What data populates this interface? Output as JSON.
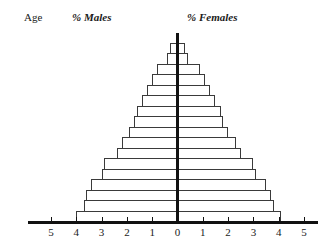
{
  "headings": {
    "age": "Age",
    "males": "% Males",
    "females": "% Females"
  },
  "axis": {
    "x_ticks": [
      "5",
      "4",
      "3",
      "2",
      "1",
      "0",
      "1",
      "2",
      "3",
      "4",
      "5"
    ],
    "x_min": -5,
    "x_max": 5,
    "unit": "%"
  },
  "chart_data": {
    "type": "bar",
    "subtype": "population-pyramid",
    "title": "",
    "subtitle": "",
    "xlabel": "",
    "ylabel": "Age",
    "xlim": [
      -5,
      5
    ],
    "grid": false,
    "legend_position": "top",
    "orientation": "horizontal",
    "categories": [
      "80+",
      "75–79",
      "70–74",
      "65–69",
      "60–64",
      "55–59",
      "50–54",
      "45–49",
      "40–44",
      "35–39",
      "30–34",
      "25–29",
      "20–24",
      "15–19",
      "10–14",
      "5–9",
      "0–4"
    ],
    "series": [
      {
        "name": "% Males",
        "side": "left",
        "values": [
          0.3,
          0.4,
          0.8,
          1.0,
          1.2,
          1.4,
          1.6,
          1.7,
          1.9,
          2.2,
          2.4,
          2.9,
          3.0,
          3.4,
          3.6,
          3.7,
          4.0
        ]
      },
      {
        "name": "% Females",
        "side": "right",
        "values": [
          0.3,
          0.4,
          0.9,
          1.1,
          1.3,
          1.5,
          1.7,
          1.8,
          2.0,
          2.3,
          2.5,
          3.0,
          3.1,
          3.5,
          3.7,
          3.8,
          4.1
        ]
      }
    ]
  }
}
